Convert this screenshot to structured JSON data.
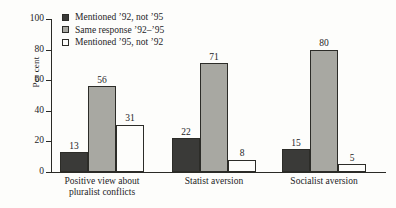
{
  "chart_data": {
    "type": "bar",
    "title": "",
    "xlabel": "",
    "ylabel": "Per cent",
    "ylim": [
      0,
      100
    ],
    "yticks": [
      "0",
      "20",
      "40",
      "60",
      "80",
      "100"
    ],
    "grid": false,
    "legend_position": "top-left",
    "categories": [
      "Positive view about pluralist conflicts",
      "Statist aversion",
      "Socialist aversion"
    ],
    "category_lines": [
      [
        "Positive view about",
        "pluralist conflicts"
      ],
      [
        "Statist aversion"
      ],
      [
        "Socialist aversion"
      ]
    ],
    "series": [
      {
        "name": "Mentioned ’92, not ’95",
        "color": "#3a3a38",
        "values": [
          13,
          22,
          15
        ]
      },
      {
        "name": "Same response ’92–’95",
        "color": "#a8a8a2",
        "values": [
          56,
          71,
          80
        ]
      },
      {
        "name": "Mentioned ’95, not ’92",
        "color": "#fdfdfb",
        "values": [
          31,
          8,
          5
        ]
      }
    ]
  },
  "colors": {
    "background": "#fdfdfb",
    "axis": "#2a2a26",
    "text": "#24241f",
    "series_dark": "#3a3a38",
    "series_mid": "#a8a8a2",
    "series_light": "#fdfdfb"
  }
}
